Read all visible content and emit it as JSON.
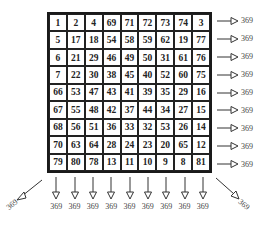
{
  "grid": {
    "size": 9,
    "rows": [
      [
        1,
        2,
        4,
        69,
        71,
        72,
        73,
        74,
        3
      ],
      [
        5,
        17,
        18,
        54,
        58,
        59,
        62,
        19,
        77
      ],
      [
        6,
        21,
        29,
        46,
        49,
        50,
        31,
        61,
        76
      ],
      [
        7,
        22,
        30,
        38,
        45,
        40,
        52,
        60,
        75
      ],
      [
        66,
        53,
        47,
        43,
        41,
        39,
        35,
        29,
        16
      ],
      [
        67,
        55,
        48,
        42,
        37,
        44,
        34,
        27,
        15
      ],
      [
        68,
        56,
        51,
        36,
        33,
        32,
        53,
        26,
        14
      ],
      [
        70,
        63,
        64,
        28,
        24,
        23,
        20,
        65,
        12
      ],
      [
        79,
        80,
        78,
        13,
        11,
        10,
        9,
        8,
        81
      ]
    ]
  },
  "row_sums": [
    "369",
    "369",
    "369",
    "369",
    "369",
    "369",
    "369",
    "369",
    "369"
  ],
  "column_sums": [
    "369",
    "369",
    "369",
    "369",
    "369",
    "369",
    "369",
    "369",
    "369"
  ],
  "diagonal_sums": {
    "anti_diagonal": "369",
    "main_diagonal": "369"
  },
  "colors": {
    "grid_line": "#1a1a1a",
    "text": "#222222",
    "label": "#444444",
    "background": "#ffffff"
  }
}
